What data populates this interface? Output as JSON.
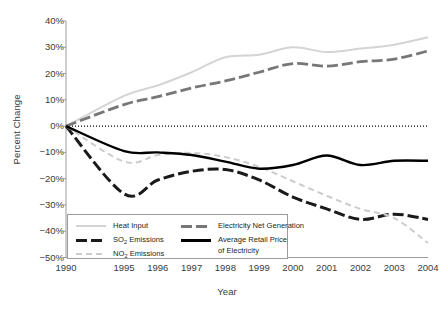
{
  "chart_data": {
    "type": "line",
    "title": "",
    "xlabel": "Year",
    "ylabel": "Percent Change",
    "ylim": [
      -50,
      40
    ],
    "ytick_labels": [
      "40%",
      "30%",
      "20%",
      "10%",
      "0%",
      "−10%",
      "−20%",
      "−30%",
      "−40%",
      "−50%"
    ],
    "ytick_values": [
      40,
      30,
      20,
      10,
      0,
      -10,
      -20,
      -30,
      -40,
      -50
    ],
    "xtick_labels": [
      "1990",
      "1995",
      "1996",
      "1997",
      "1998",
      "1999",
      "2000",
      "2001",
      "2002",
      "2003",
      "2004"
    ],
    "x": [
      1990,
      1995,
      1996,
      1997,
      1998,
      1999,
      2000,
      2001,
      2002,
      2003,
      2004
    ],
    "grid": false,
    "zero_reference_line": true,
    "legend_position": "lower-left-inside",
    "series": [
      {
        "name": "Heat Input",
        "style": "solid",
        "color": "#d4d4d4",
        "width": 2.0,
        "values": [
          0,
          11.5,
          15.5,
          20.5,
          26.2,
          27.2,
          30.0,
          28.2,
          29.5,
          31.0,
          33.8
        ]
      },
      {
        "name": "SO₂ Emissions",
        "style": "dashed-heavy",
        "color": "#1a1a1a",
        "width": 3.0,
        "values": [
          0,
          -25.8,
          -20.5,
          -17.2,
          -16.5,
          -20.5,
          -27.0,
          -31.5,
          -35.5,
          -33.5,
          -35.5
        ]
      },
      {
        "name": "NO₂ Emissions",
        "style": "dashed-light",
        "color": "#cccccc",
        "width": 2.0,
        "values": [
          0,
          -13.5,
          -11.0,
          -10.2,
          -11.8,
          -15.5,
          -21.0,
          -26.5,
          -31.5,
          -35.0,
          -44.5
        ]
      },
      {
        "name": "Electricity Net Generation",
        "style": "dashed-medium",
        "color": "#777777",
        "width": 2.8,
        "values": [
          0,
          8.2,
          11.2,
          14.5,
          17.2,
          20.5,
          23.8,
          22.8,
          24.5,
          25.5,
          28.6
        ]
      },
      {
        "name": "Average Retail Price of Electricity",
        "style": "solid-heavy",
        "color": "#000000",
        "width": 2.4,
        "values": [
          0,
          -9.5,
          -10.0,
          -11.0,
          -13.5,
          -16.2,
          -14.8,
          -11.2,
          -14.8,
          -13.2,
          -13.2
        ]
      }
    ],
    "legend": [
      {
        "label": "Heat Input",
        "swatch": "solid-light-gray"
      },
      {
        "label": "Electricity Net Generation",
        "swatch": "dashed-medium-gray"
      },
      {
        "label_pre": "SO",
        "label_sub": "2",
        "label_post": " Emissions",
        "swatch": "dashed-heavy-black"
      },
      {
        "label_pre": "",
        "label_sub": "",
        "label_post": "Average Retail Price",
        "label_line2": "of Electricity",
        "swatch": "solid-heavy-black"
      },
      {
        "label_pre": "NO",
        "label_sub": "2",
        "label_post": " Emissions",
        "swatch": "dashed-light-gray"
      }
    ]
  },
  "colors": {
    "axis": "#9b9b9b",
    "text": "#3b3b3b",
    "heat_input": "#d4d4d4",
    "so2": "#1a1a1a",
    "nox": "#cccccc",
    "net_generation": "#777777",
    "retail_price": "#000000"
  }
}
